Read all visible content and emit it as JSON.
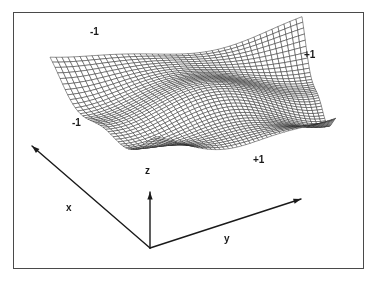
{
  "figure": {
    "title": "",
    "background_color": "#ffffff",
    "border_color": "#4a4a4a",
    "ink_color": "#1a1a1a",
    "mesh_color": "#2b2b2b"
  },
  "axes": {
    "x": {
      "label": "x",
      "label_x": 66,
      "label_y": 203
    },
    "y": {
      "label": "y",
      "label_y_pos": 234,
      "label_x": 224
    },
    "z": {
      "label": "z",
      "label_x": 145,
      "label_y": 166
    }
  },
  "corner_labels": [
    {
      "id": "far-left",
      "text": "-1",
      "x": 90,
      "y": 27
    },
    {
      "id": "far-right",
      "text": "+1",
      "x": 304,
      "y": 50
    },
    {
      "id": "near-left",
      "text": "-1",
      "x": 72,
      "y": 118
    },
    {
      "id": "near-right",
      "text": "+1",
      "x": 253,
      "y": 155
    }
  ],
  "chart_data": {
    "type": "surface",
    "title": "",
    "xlabel": "x",
    "ylabel": "y",
    "zlabel": "z",
    "xlim": [
      -1,
      1
    ],
    "ylim": [
      -1,
      1
    ],
    "grid": true,
    "legend": "none",
    "mesh_divisions_x": 40,
    "mesh_divisions_y": 40,
    "corner_tick_labels": [
      "-1",
      "+1",
      "-1",
      "+1"
    ],
    "x": [
      -1,
      -0.75,
      -0.5,
      -0.25,
      0,
      0.25,
      0.5,
      0.75,
      1
    ],
    "y": [
      -1,
      -0.75,
      -0.5,
      -0.25,
      0,
      0.25,
      0.5,
      0.75,
      1
    ],
    "z": [
      [
        0.72,
        0.52,
        0.3,
        0.12,
        0.02,
        0.04,
        0.16,
        0.38,
        0.66
      ],
      [
        0.55,
        0.36,
        0.17,
        0.03,
        -0.05,
        -0.02,
        0.1,
        0.3,
        0.56
      ],
      [
        0.36,
        0.19,
        0.03,
        -0.08,
        -0.14,
        -0.1,
        0.0,
        0.2,
        0.44
      ],
      [
        0.2,
        0.05,
        -0.08,
        -0.18,
        -0.22,
        -0.18,
        -0.08,
        0.1,
        0.33
      ],
      [
        0.1,
        -0.04,
        -0.16,
        -0.24,
        -0.28,
        -0.24,
        -0.14,
        0.04,
        0.26
      ],
      [
        0.12,
        -0.02,
        -0.13,
        -0.21,
        -0.25,
        -0.2,
        -0.1,
        0.08,
        0.3
      ],
      [
        0.24,
        0.08,
        -0.04,
        -0.12,
        -0.15,
        -0.1,
        0.01,
        0.2,
        0.42
      ],
      [
        0.45,
        0.27,
        0.12,
        0.02,
        -0.01,
        0.05,
        0.18,
        0.38,
        0.6
      ],
      [
        0.7,
        0.5,
        0.32,
        0.18,
        0.14,
        0.2,
        0.34,
        0.55,
        0.78
      ]
    ]
  },
  "geometry": {
    "frame": {
      "x": 13,
      "y": 12,
      "width": 350,
      "height": 256
    },
    "origin": {
      "x": 150,
      "y": 248
    },
    "x_axis_tip": {
      "x": 32,
      "y": 146
    },
    "y_axis_tip": {
      "x": 301,
      "y": 199
    },
    "z_axis_tip": {
      "x": 150,
      "y": 192
    },
    "surface_corner_left": {
      "x": 50,
      "y": 70
    },
    "surface_corner_far": {
      "x": 302,
      "y": 36
    },
    "surface_corner_right": {
      "x": 336,
      "y": 131
    },
    "surface_corner_near": {
      "x": 156,
      "y": 156
    }
  }
}
